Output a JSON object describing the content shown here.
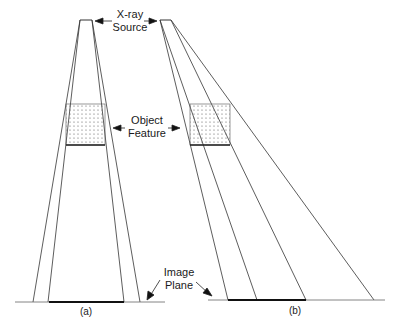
{
  "labels": {
    "source_line1": "X-ray",
    "source_line2": "Source",
    "object_line1": "Object",
    "object_line2": "Feature",
    "plane_line1": "Image",
    "plane_line2": "Plane",
    "panel_a": "(a)",
    "panel_b": "(b)"
  },
  "colors": {
    "line": "#333333",
    "image_bar": "#111111",
    "dots": "#555555"
  }
}
